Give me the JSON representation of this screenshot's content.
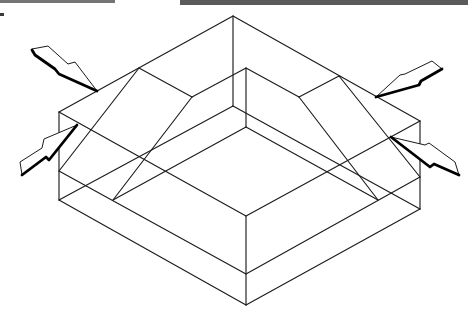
{
  "canvas": {
    "width": 475,
    "height": 323,
    "background": "#ffffff"
  },
  "colors": {
    "line": "#1c1c1c",
    "arrow_fill": "#ffffff",
    "arrow_outline": "#1a1a1a",
    "arrow_shadow": "#000000"
  },
  "scan_bars": [
    {
      "name": "scan-bar-left",
      "x": 0,
      "y": 0,
      "w": 115,
      "h": 3,
      "color": "#747474"
    },
    {
      "name": "scan-bar-right",
      "x": 180,
      "y": 0,
      "w": 288,
      "h": 5,
      "color": "#5a5a5a"
    },
    {
      "name": "scan-mark",
      "x": 0,
      "y": 13,
      "w": 4,
      "h": 3,
      "color": "#3a3a3a"
    }
  ],
  "block_diagram": {
    "vertices": {
      "top": [
        233,
        16
      ],
      "left": [
        59,
        112
      ],
      "right": [
        420,
        121
      ],
      "front": [
        246,
        216
      ],
      "top_base": [
        233,
        106
      ],
      "left_base": [
        59,
        200
      ],
      "right_base": [
        420,
        209
      ],
      "front_base": [
        246,
        305
      ],
      "left_mid": [
        59,
        171
      ],
      "right_mid": [
        420,
        177
      ],
      "front_mid": [
        246,
        274
      ],
      "ridge_left": [
        139,
        68
      ],
      "ridge_right": [
        339,
        76
      ],
      "inner_top": [
        246,
        68
      ],
      "inner_left": [
        192,
        97
      ],
      "inner_right": [
        299,
        97
      ],
      "inner_front": [
        246,
        127
      ],
      "foot_left": [
        113,
        200
      ],
      "foot_right": [
        378,
        200
      ]
    },
    "edges": [
      {
        "name": "outer-top-left-edge",
        "from": "top",
        "to": "left"
      },
      {
        "name": "outer-top-right-edge",
        "from": "top",
        "to": "right"
      },
      {
        "name": "outer-front-left-edge",
        "from": "left",
        "to": "front"
      },
      {
        "name": "outer-front-right-edge",
        "from": "front",
        "to": "right"
      },
      {
        "name": "left-vertical-edge",
        "from": "left",
        "to": "left_base"
      },
      {
        "name": "right-vertical-edge",
        "from": "right",
        "to": "right_base"
      },
      {
        "name": "front-vertical-edge",
        "from": "front",
        "to": "front_base"
      },
      {
        "name": "back-vertical-edge",
        "from": "top",
        "to": "top_base"
      },
      {
        "name": "base-front-left-edge",
        "from": "left_base",
        "to": "front_base"
      },
      {
        "name": "base-front-right-edge",
        "from": "front_base",
        "to": "right_base"
      },
      {
        "name": "base-back-left-edge",
        "from": "left_base",
        "to": "top_base"
      },
      {
        "name": "base-back-right-edge",
        "from": "top_base",
        "to": "right_base"
      },
      {
        "name": "layer-front-left-edge",
        "from": "left_mid",
        "to": "front_mid"
      },
      {
        "name": "layer-front-right-edge",
        "from": "front_mid",
        "to": "right_mid"
      },
      {
        "name": "inner-top-left-edge",
        "from": "inner_top",
        "to": "inner_left"
      },
      {
        "name": "inner-top-right-edge",
        "from": "inner_top",
        "to": "inner_right"
      },
      {
        "name": "ridge-left-to-inner",
        "from": "ridge_left",
        "to": "inner_left"
      },
      {
        "name": "ridge-right-to-inner",
        "from": "ridge_right",
        "to": "inner_right"
      },
      {
        "name": "inner-vertical-edge",
        "from": "inner_top",
        "to": "inner_front"
      },
      {
        "name": "inner-front-left-slope",
        "from": "inner_front",
        "to": "foot_left"
      },
      {
        "name": "inner-front-right-slope",
        "from": "inner_front",
        "to": "foot_right"
      },
      {
        "name": "inner-left-fault",
        "from": "inner_left",
        "to": "foot_left"
      },
      {
        "name": "inner-right-fault",
        "from": "inner_right",
        "to": "foot_right"
      },
      {
        "name": "ridge-left-fault",
        "from": "ridge_left",
        "to": "left_mid"
      },
      {
        "name": "ridge-right-fault",
        "from": "ridge_right",
        "to": "right_mid"
      }
    ]
  },
  "arrows": [
    {
      "name": "compression-arrow-top-left",
      "direction": "down-right",
      "outline": [
        [
          32,
          49
        ],
        [
          48,
          46
        ],
        [
          68,
          64
        ],
        [
          75,
          62
        ],
        [
          97,
          91
        ],
        [
          59,
          74
        ],
        [
          55,
          69
        ],
        [
          35,
          55
        ]
      ],
      "shadow": [
        [
          97,
          91
        ],
        [
          59,
          74
        ],
        [
          55,
          69
        ],
        [
          35,
          55
        ],
        [
          32,
          50
        ]
      ]
    },
    {
      "name": "compression-arrow-bottom-left",
      "direction": "up-right",
      "outline": [
        [
          20,
          162
        ],
        [
          42,
          148
        ],
        [
          44,
          139
        ],
        [
          77,
          125
        ],
        [
          49,
          160
        ],
        [
          46,
          157
        ],
        [
          22,
          175
        ]
      ],
      "shadow": [
        [
          77,
          125
        ],
        [
          49,
          160
        ],
        [
          46,
          157
        ],
        [
          22,
          175
        ]
      ]
    },
    {
      "name": "compression-arrow-top-right",
      "direction": "down-left",
      "outline": [
        [
          376,
          97
        ],
        [
          400,
          75
        ],
        [
          405,
          74
        ],
        [
          432,
          61
        ],
        [
          442,
          69
        ],
        [
          421,
          81
        ],
        [
          419,
          85
        ]
      ],
      "shadow": [
        [
          442,
          69
        ],
        [
          421,
          81
        ],
        [
          419,
          85
        ],
        [
          376,
          97
        ]
      ]
    },
    {
      "name": "compression-arrow-bottom-right",
      "direction": "up-left",
      "outline": [
        [
          391,
          137
        ],
        [
          425,
          145
        ],
        [
          429,
          143
        ],
        [
          455,
          162
        ],
        [
          459,
          175
        ],
        [
          434,
          164
        ],
        [
          430,
          167
        ]
      ],
      "shadow": [
        [
          459,
          175
        ],
        [
          434,
          164
        ],
        [
          430,
          167
        ],
        [
          391,
          137
        ]
      ]
    }
  ]
}
